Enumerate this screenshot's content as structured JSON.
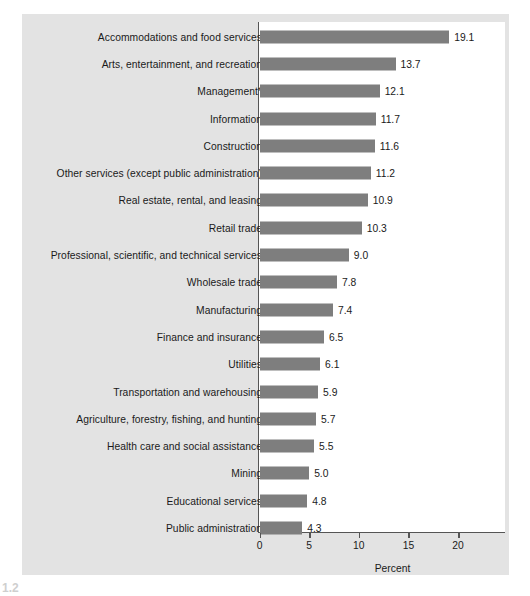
{
  "chart_data": {
    "type": "bar",
    "orientation": "horizontal",
    "title": "",
    "xlabel": "Percent",
    "ylabel": "",
    "xlim": [
      0,
      22.2
    ],
    "xticks": [
      0,
      5,
      10,
      15,
      20
    ],
    "xtick_labels": [
      "0",
      "5",
      "10",
      "15",
      "20"
    ],
    "grid": false,
    "legend": null,
    "bar_color": "#7e7e7e",
    "plot_background": "#ffffff",
    "figure_background": "#e3e3e3",
    "categories": [
      "Accommodations and food services",
      "Arts, entertainment, and recreation",
      "Management*",
      "Information",
      "Construction",
      "Other services (except public administration)",
      "Real estate, rental, and leasing",
      "Retail trade",
      "Professional, scientific, and technical services",
      "Wholesale trade",
      "Manufacturing",
      "Finance and insurance",
      "Utilities",
      "Transportation and warehousing",
      "Agriculture, forestry, fishing, and hunting",
      "Health care and social assistance",
      "Mining",
      "Educational services",
      "Public administration"
    ],
    "values": [
      19.1,
      13.7,
      12.1,
      11.7,
      11.6,
      11.2,
      10.9,
      10.3,
      9.0,
      7.8,
      7.4,
      6.5,
      6.1,
      5.9,
      5.7,
      5.5,
      5.0,
      4.8,
      4.3
    ],
    "value_labels": [
      "19.1",
      "13.7",
      "12.1",
      "11.7",
      "11.6",
      "11.2",
      "10.9",
      "10.3",
      "9.0",
      "7.8",
      "7.4",
      "6.5",
      "6.1",
      "5.9",
      "5.7",
      "5.5",
      "5.0",
      "4.8",
      "4.3"
    ]
  },
  "caption": {
    "number": "1.2",
    "text": ""
  }
}
